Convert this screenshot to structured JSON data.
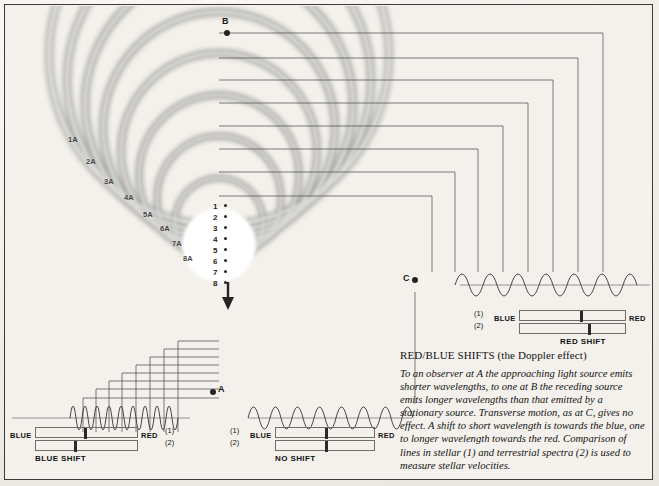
{
  "diagram": {
    "title": "RED/BLUE SHIFTS (the Doppler effect)",
    "body": "To an observer at A the approaching light source emits shorter wavelengths, to one at B the receding source emits longer wavelengths than that emitted by a stationary source. Transverse motion, as at C, gives no effect. A shift to short wavelength is towards the blue, one to longer wavelength towards the red. Comparison of lines in stellar (1) and terrestrial spectra (2) is used to measure stellar velocities."
  },
  "observers": [
    {
      "id": "B",
      "label": "B",
      "x": 227,
      "y": 33,
      "label_x": 222,
      "label_y": 18
    },
    {
      "id": "C",
      "label": "C",
      "x": 415,
      "y": 280,
      "label_x": 403,
      "label_y": 275
    },
    {
      "id": "A",
      "label": "A",
      "x": 213,
      "y": 391,
      "label_x": 218,
      "label_y": 386
    }
  ],
  "wavefront_labels": [
    {
      "text": "1A",
      "x": 68,
      "y": 136
    },
    {
      "text": "2A",
      "x": 86,
      "y": 158
    },
    {
      "text": "3A",
      "x": 104,
      "y": 178
    },
    {
      "text": "4A",
      "x": 124,
      "y": 194
    },
    {
      "text": "5A",
      "x": 143,
      "y": 211
    },
    {
      "text": "6A",
      "x": 160,
      "y": 225
    },
    {
      "text": "7A",
      "x": 172,
      "y": 240
    },
    {
      "text": "8A",
      "x": 183,
      "y": 255
    }
  ],
  "source_positions": [
    {
      "n": "1",
      "x": 216,
      "y": 207
    },
    {
      "n": "2",
      "x": 216,
      "y": 218
    },
    {
      "n": "3",
      "x": 216,
      "y": 229
    },
    {
      "n": "4",
      "x": 216,
      "y": 240
    },
    {
      "n": "5",
      "x": 216,
      "y": 251
    },
    {
      "n": "6",
      "x": 216,
      "y": 262
    },
    {
      "n": "7",
      "x": 216,
      "y": 273
    },
    {
      "n": "8",
      "x": 216,
      "y": 284
    }
  ],
  "panels": {
    "red_shift": {
      "caption": "RED SHIFT",
      "blue_label": "BLUE",
      "red_label": "RED",
      "row1_label": "(1)",
      "row2_label": "(2)",
      "line1_pct": 57,
      "line2_pct": 65,
      "waveform": "stretched"
    },
    "no_shift": {
      "caption": "NO SHIFT",
      "blue_label": "BLUE",
      "red_label": "RED",
      "row1_label": "(1)",
      "row2_label": "(2)",
      "line1_pct": 50,
      "line2_pct": 50,
      "waveform": "normal"
    },
    "blue_shift": {
      "caption": "BLUE SHIFT",
      "blue_label": "BLUE",
      "red_label": "RED",
      "row1_label": "(1)",
      "row2_label": "(2)",
      "line1_pct": 48,
      "line2_pct": 38,
      "waveform": "compressed"
    }
  },
  "colors": {
    "ink": "#1e1e1e",
    "paper": "#f2efe9",
    "wave_gray": "#9a9a96",
    "spectrum_line": "#2a2a28"
  }
}
